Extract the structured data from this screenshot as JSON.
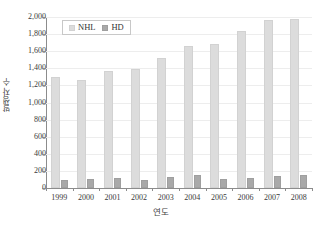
{
  "chart_data": {
    "type": "bar",
    "title": "",
    "xlabel": "연도",
    "ylabel": "발생자 수",
    "categories": [
      "1999",
      "2000",
      "2001",
      "2002",
      "2003",
      "2004",
      "2005",
      "2006",
      "2007",
      "2008"
    ],
    "series": [
      {
        "name": "NHL",
        "color": "#dcdcdc",
        "values": [
          1298,
          1263,
          1368,
          1392,
          1520,
          1660,
          1684,
          1836,
          1965,
          1977
        ]
      },
      {
        "name": "HD",
        "color": "#a9a9a9",
        "values": [
          98,
          103,
          117,
          97,
          128,
          152,
          110,
          119,
          146,
          148
        ]
      }
    ],
    "ylim": [
      0,
      2000
    ],
    "ytick_values": [
      0,
      200,
      400,
      600,
      800,
      1000,
      1200,
      1400,
      1600,
      1800,
      2000
    ],
    "ytick_labels": [
      "0",
      "200",
      "400",
      "600",
      "800",
      "1,000",
      "1,200",
      "1,400",
      "1,600",
      "1,800",
      "2,000"
    ],
    "grid": true,
    "legend_position": "top-left"
  },
  "legend": {
    "items": [
      {
        "label": "NHL",
        "swatch": "legend-swatch-nhl"
      },
      {
        "label": "HD",
        "swatch": "legend-swatch-hd"
      }
    ]
  },
  "axis": {
    "y_title": "발생자 수",
    "x_title": "연도"
  }
}
